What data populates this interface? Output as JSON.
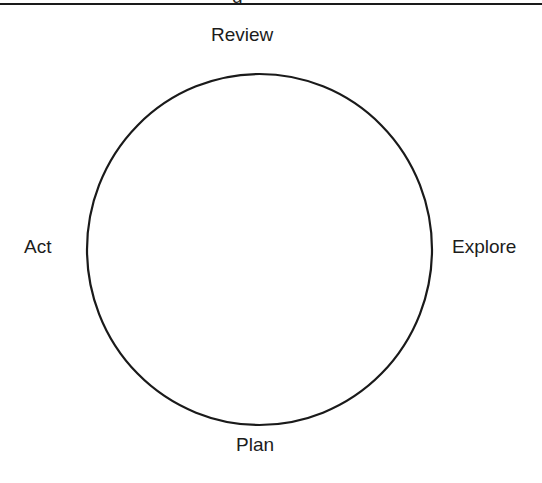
{
  "diagram": {
    "type": "cycle",
    "shape": "circle",
    "stroke_color": "#1a1a1a",
    "nodes": [
      {
        "label": "Review",
        "position": "top"
      },
      {
        "label": "Explore",
        "position": "right"
      },
      {
        "label": "Plan",
        "position": "bottom"
      },
      {
        "label": "Act",
        "position": "left"
      }
    ]
  },
  "header": {
    "clipped_title_fragment": "g"
  }
}
